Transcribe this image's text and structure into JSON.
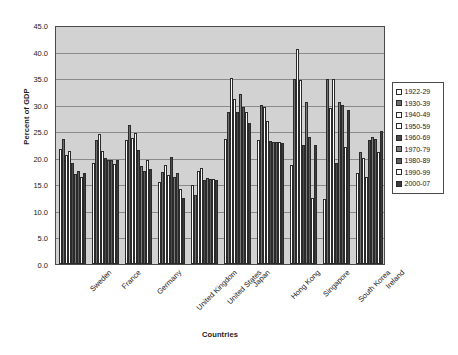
{
  "chart_data": {
    "type": "bar",
    "title": "",
    "xlabel": "Countries",
    "ylabel": "Percent of GDP",
    "ylim": [
      0.0,
      45.0
    ],
    "ytick_step": 5.0,
    "ytick_labels": [
      "45.0",
      "40.0",
      "35.0",
      "30.0",
      "25.0",
      "20.0",
      "15.0",
      "10.0",
      "5.0",
      "0.0"
    ],
    "grid": true,
    "legend_position": "right",
    "categories": [
      "Sweden",
      "France",
      "Germany",
      "United Kingdom",
      "United States",
      "Japan",
      "Hong Kong",
      "Singapore",
      "South Korea",
      "Ireland"
    ],
    "series": [
      {
        "name": "1922-29",
        "color": "#ffffff",
        "values": [
          21.6,
          19.0,
          23.3,
          15.5,
          14.8,
          23.5,
          23.3,
          18.6,
          12.2,
          17.2
        ]
      },
      {
        "name": "1930-39",
        "color": "#6e6e6e",
        "values": [
          23.5,
          23.3,
          26.2,
          17.3,
          13.0,
          28.6,
          29.9,
          34.8,
          34.8,
          21.0
        ]
      },
      {
        "name": "1940-49",
        "color": "#ffffff",
        "values": [
          20.6,
          24.4,
          23.8,
          18.6,
          17.6,
          35.0,
          29.5,
          40.5,
          29.3,
          20.0
        ]
      },
      {
        "name": "1950-59",
        "color": "#ffffff",
        "values": [
          21.2,
          21.2,
          24.6,
          16.8,
          18.0,
          31.0,
          27.0,
          34.7,
          34.8,
          16.3
        ]
      },
      {
        "name": "1960-69",
        "color": "#4a4a4a",
        "values": [
          19.0,
          20.0,
          21.5,
          20.2,
          15.9,
          28.6,
          23.2,
          22.5,
          19.0,
          23.3
        ]
      },
      {
        "name": "1970-79",
        "color": "#7c7c7c",
        "values": [
          16.9,
          19.5,
          18.5,
          16.3,
          16.2,
          32.0,
          23.0,
          30.5,
          30.5,
          24.0
        ]
      },
      {
        "name": "1980-89",
        "color": "#5d5d5d",
        "values": [
          17.5,
          19.5,
          17.5,
          17.2,
          16.0,
          29.5,
          23.0,
          24.0,
          30.0,
          23.5
        ]
      },
      {
        "name": "1990-99",
        "color": "#ffffff",
        "values": [
          16.4,
          18.9,
          19.6,
          14.1,
          16.0,
          28.6,
          23.0,
          12.4,
          22.0,
          21.0
        ]
      },
      {
        "name": "2000-07",
        "color": "#3c3c3c",
        "values": [
          17.2,
          19.5,
          17.9,
          12.5,
          15.8,
          26.5,
          22.8,
          22.5,
          29.0,
          25.0
        ]
      }
    ]
  },
  "legend": {
    "items": [
      {
        "label": "1922-29"
      },
      {
        "label": "1930-39"
      },
      {
        "label": "1940-49"
      },
      {
        "label": "1950-59"
      },
      {
        "label": "1960-69"
      },
      {
        "label": "1970-79"
      },
      {
        "label": "1980-89"
      },
      {
        "label": "1990-99"
      },
      {
        "label": "2000-07"
      }
    ]
  }
}
